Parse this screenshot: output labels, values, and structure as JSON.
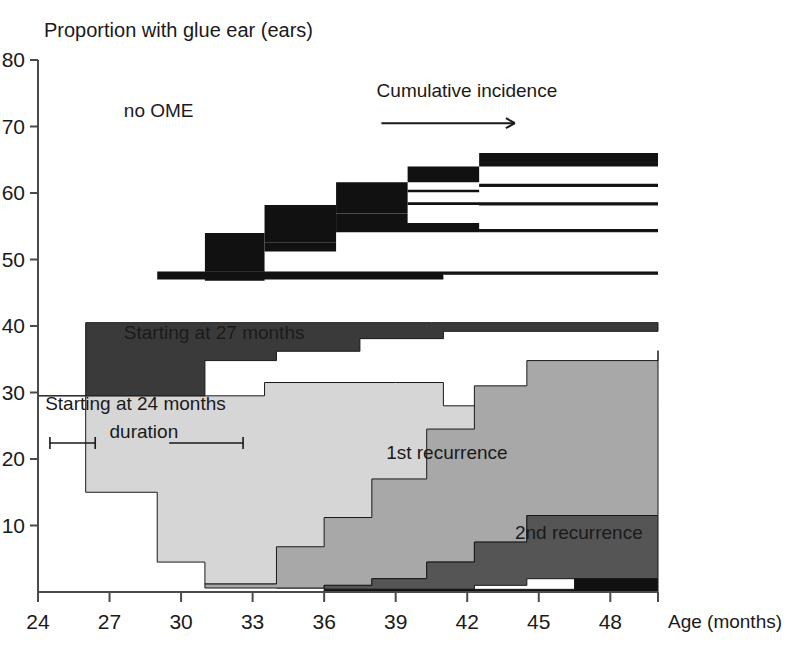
{
  "chart_data": {
    "type": "area",
    "title": "Proportion with glue ear (ears)",
    "xlabel": "Age (months)",
    "ylabel": "",
    "xlim": [
      24,
      50
    ],
    "ylim": [
      0,
      80
    ],
    "grid": false,
    "legend_position": "inline-annotations",
    "x_ticks": [
      24,
      27,
      30,
      33,
      36,
      39,
      42,
      45,
      48
    ],
    "x_tick_labels": [
      "24",
      "27",
      "30",
      "33",
      "36",
      "39",
      "42",
      "45",
      "48"
    ],
    "y_ticks": [
      10,
      20,
      30,
      40,
      50,
      60,
      70,
      80
    ],
    "y_tick_labels": [
      "10",
      "20",
      "30",
      "40",
      "50",
      "60",
      "70",
      "80"
    ],
    "annotations": [
      {
        "name": "no-ome",
        "text": "no OME",
        "x": 27.6,
        "y": 71.5
      },
      {
        "name": "cumulative-incidence",
        "text": "Cumulative incidence",
        "x": 38.2,
        "y": 74.5
      },
      {
        "name": "starting-27",
        "text": "Starting at 27 months",
        "x": 27.6,
        "y": 38.0
      },
      {
        "name": "starting-24",
        "text": "Starting at 24 months",
        "x": 24.3,
        "y": 27.3
      },
      {
        "name": "duration",
        "text": "duration",
        "x": 27.0,
        "y": 23.2
      },
      {
        "name": "first-recurrence",
        "text": "1st recurrence",
        "x": 38.6,
        "y": 20.0
      },
      {
        "name": "second-recurrence",
        "text": "2nd recurrence",
        "x": 44.0,
        "y": 8.0
      }
    ],
    "series": [
      {
        "name": "Starting at 24 months",
        "color": "#d6d6d6",
        "steps": [
          {
            "x": 24,
            "y": 29.5
          },
          {
            "x": 26,
            "y": 15.0
          },
          {
            "x": 29,
            "y": 4.5
          },
          {
            "x": 31,
            "y": 1.2
          },
          {
            "x": 34,
            "y": 0.6
          },
          {
            "x": 40.5,
            "y": 0.0
          }
        ],
        "top_steps": [
          {
            "x": 24,
            "y": 29.5
          },
          {
            "x": 31,
            "y": 29.5
          },
          {
            "x": 33.5,
            "y": 31.5
          },
          {
            "x": 39.0,
            "y": 31.5
          },
          {
            "x": 41.0,
            "y": 28.0
          },
          {
            "x": 50,
            "y": 28.0
          }
        ]
      },
      {
        "name": "Starting at 27 months",
        "color": "#3a3a3a",
        "top_steps": [
          {
            "x": 26,
            "y": 40.5
          },
          {
            "x": 40.5,
            "y": 40.5
          },
          {
            "x": 50,
            "y": 40.5
          }
        ],
        "bottom_steps": [
          {
            "x": 26,
            "y": 29.5
          },
          {
            "x": 29,
            "y": 29.5
          },
          {
            "x": 31,
            "y": 34.8
          },
          {
            "x": 34,
            "y": 36.2
          },
          {
            "x": 37.5,
            "y": 38.1
          },
          {
            "x": 41.0,
            "y": 39.2
          },
          {
            "x": 50,
            "y": 39.9
          }
        ]
      },
      {
        "name": "1st recurrence",
        "color": "#a8a8a8",
        "top_steps": [
          {
            "x": 31,
            "y": 1.2
          },
          {
            "x": 34,
            "y": 6.8
          },
          {
            "x": 36,
            "y": 11.2
          },
          {
            "x": 38,
            "y": 17.0
          },
          {
            "x": 40.3,
            "y": 24.5
          },
          {
            "x": 42.3,
            "y": 31.0
          },
          {
            "x": 44.5,
            "y": 34.8
          },
          {
            "x": 50,
            "y": 36.3
          }
        ],
        "bottom_steps": [
          {
            "x": 31,
            "y": 0.6
          },
          {
            "x": 34,
            "y": 0.6
          },
          {
            "x": 36,
            "y": 1.0
          },
          {
            "x": 38,
            "y": 2.0
          },
          {
            "x": 40.3,
            "y": 4.5
          },
          {
            "x": 42.3,
            "y": 7.5
          },
          {
            "x": 44.5,
            "y": 11.5
          },
          {
            "x": 50,
            "y": 27.8
          }
        ]
      },
      {
        "name": "2nd recurrence",
        "color": "#555555",
        "top_steps": [
          {
            "x": 36,
            "y": 1.0
          },
          {
            "x": 38,
            "y": 2.0
          },
          {
            "x": 40.3,
            "y": 4.5
          },
          {
            "x": 42.3,
            "y": 7.5
          },
          {
            "x": 44.5,
            "y": 11.5
          },
          {
            "x": 50,
            "y": 11.5
          }
        ],
        "bottom_steps": [
          {
            "x": 36,
            "y": 0.4
          },
          {
            "x": 40.3,
            "y": 0.4
          },
          {
            "x": 42.3,
            "y": 1.0
          },
          {
            "x": 44.5,
            "y": 2.0
          },
          {
            "x": 50,
            "y": 2.0
          }
        ]
      },
      {
        "name": "3rd recurrence",
        "color": "#111111",
        "top_steps": [
          {
            "x": 36,
            "y": 0.4
          },
          {
            "x": 44.5,
            "y": 0.4
          },
          {
            "x": 46.5,
            "y": 2.0
          },
          {
            "x": 50,
            "y": 2.0
          }
        ],
        "bottom_steps": [
          {
            "x": 36,
            "y": 0.0
          },
          {
            "x": 50,
            "y": 0.0
          }
        ]
      },
      {
        "name": "Cumulative incidence (no OME boundary)",
        "color": "#111111",
        "bands": [
          {
            "top_steps": [
              {
                "x": 29,
                "y": 48.2
              },
              {
                "x": 31,
                "y": 54.0
              },
              {
                "x": 33.5,
                "y": 58.2
              },
              {
                "x": 36.5,
                "y": 61.6
              },
              {
                "x": 39.5,
                "y": 64.0
              },
              {
                "x": 42.5,
                "y": 66.0
              },
              {
                "x": 50,
                "y": 66.0
              }
            ],
            "bottom_steps": [
              {
                "x": 29,
                "y": 48.2
              },
              {
                "x": 31,
                "y": 48.2
              },
              {
                "x": 33.5,
                "y": 54.0
              },
              {
                "x": 36.5,
                "y": 58.2
              },
              {
                "x": 39.5,
                "y": 61.6
              },
              {
                "x": 42.5,
                "y": 64.0
              },
              {
                "x": 50,
                "y": 64.6
              }
            ]
          },
          {
            "top_steps": [
              {
                "x": 31,
                "y": 48.2
              },
              {
                "x": 33.5,
                "y": 54.0
              },
              {
                "x": 36.5,
                "y": 58.2
              },
              {
                "x": 39.5,
                "y": 60.5
              },
              {
                "x": 42.5,
                "y": 61.4
              },
              {
                "x": 50,
                "y": 61.4
              }
            ],
            "bottom_steps": [
              {
                "x": 31,
                "y": 46.8
              },
              {
                "x": 33.5,
                "y": 52.6
              },
              {
                "x": 36.5,
                "y": 56.9
              },
              {
                "x": 39.5,
                "y": 60.1
              },
              {
                "x": 42.5,
                "y": 61.0
              },
              {
                "x": 50,
                "y": 61.0
              }
            ]
          },
          {
            "top_steps": [
              {
                "x": 33.5,
                "y": 52.6
              },
              {
                "x": 36.5,
                "y": 56.9
              },
              {
                "x": 39.5,
                "y": 58.6
              },
              {
                "x": 42.5,
                "y": 58.6
              },
              {
                "x": 50,
                "y": 58.6
              }
            ],
            "bottom_steps": [
              {
                "x": 33.5,
                "y": 51.2
              },
              {
                "x": 36.5,
                "y": 55.5
              },
              {
                "x": 39.5,
                "y": 58.2
              },
              {
                "x": 42.5,
                "y": 58.2
              },
              {
                "x": 50,
                "y": 58.2
              }
            ]
          },
          {
            "top_steps": [
              {
                "x": 36.5,
                "y": 55.5
              },
              {
                "x": 39.5,
                "y": 55.5
              },
              {
                "x": 42.5,
                "y": 54.6
              },
              {
                "x": 50,
                "y": 54.6
              }
            ],
            "bottom_steps": [
              {
                "x": 36.5,
                "y": 54.1
              },
              {
                "x": 39.5,
                "y": 54.1
              },
              {
                "x": 42.5,
                "y": 54.2
              },
              {
                "x": 50,
                "y": 54.2
              }
            ]
          },
          {
            "top_steps": [
              {
                "x": 29,
                "y": 48.2
              },
              {
                "x": 31,
                "y": 48.2
              },
              {
                "x": 33.5,
                "y": 48.2
              },
              {
                "x": 36.5,
                "y": 48.2
              },
              {
                "x": 41.0,
                "y": 48.2
              },
              {
                "x": 50,
                "y": 48.2
              }
            ],
            "bottom_steps": [
              {
                "x": 29,
                "y": 47.0
              },
              {
                "x": 31,
                "y": 47.0
              },
              {
                "x": 33.5,
                "y": 47.0
              },
              {
                "x": 36.5,
                "y": 47.0
              },
              {
                "x": 41.0,
                "y": 47.8
              },
              {
                "x": 50,
                "y": 47.8
              }
            ]
          }
        ]
      }
    ]
  },
  "axes": {
    "y_axis_name": "proportion-axis",
    "x_axis_name": "age-axis"
  }
}
